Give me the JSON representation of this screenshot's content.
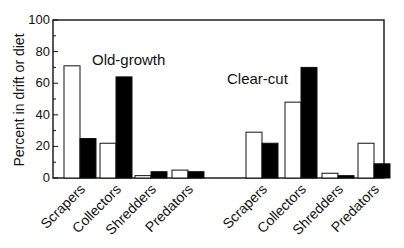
{
  "chart_data": {
    "type": "bar",
    "title": "",
    "xlabel": "",
    "ylabel": "Percent in drift or diet",
    "ylim": [
      0,
      100
    ],
    "yticks": [
      0,
      20,
      40,
      60,
      80,
      100
    ],
    "grid": false,
    "legend": null,
    "groups": [
      {
        "name": "Old-growth",
        "categories": [
          "Scrapers",
          "Collectors",
          "Shredders",
          "Predators"
        ],
        "series": [
          {
            "name": "Drift (open bars)",
            "fill": "#ffffff",
            "values": [
              71,
              22,
              1.5,
              5
            ]
          },
          {
            "name": "Diet (filled bars)",
            "fill": "#000000",
            "values": [
              25,
              64,
              4,
              4
            ]
          }
        ]
      },
      {
        "name": "Clear-cut",
        "categories": [
          "Scrapers",
          "Collectors",
          "Shredders",
          "Predators"
        ],
        "series": [
          {
            "name": "Drift (open bars)",
            "fill": "#ffffff",
            "values": [
              29,
              48,
              3,
              22
            ]
          },
          {
            "name": "Diet (filled bars)",
            "fill": "#000000",
            "values": [
              22,
              70,
              1.5,
              9
            ]
          }
        ]
      }
    ],
    "annotations": [
      "Old-growth",
      "Clear-cut"
    ]
  }
}
